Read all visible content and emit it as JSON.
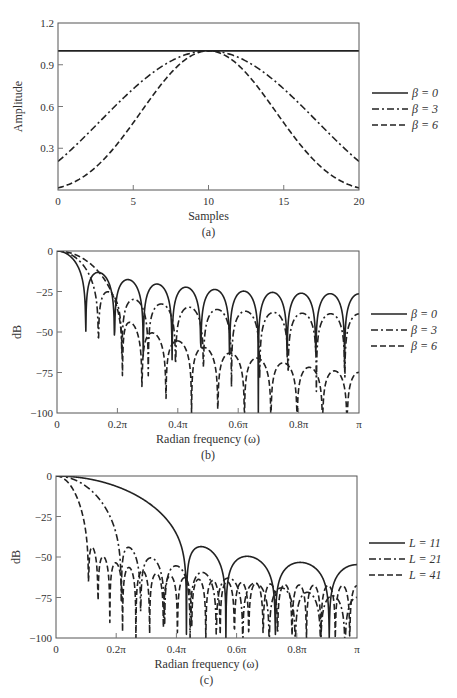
{
  "chart_data": [
    {
      "id": "a",
      "type": "line",
      "caption": "(a)",
      "title": "",
      "xlabel": "Samples",
      "ylabel": "Amplitude",
      "xlim": [
        0,
        20
      ],
      "ylim": [
        0,
        1.2
      ],
      "xticks": [
        0,
        5,
        10,
        15,
        20
      ],
      "xtick_labels": [
        "0",
        "5",
        "10",
        "15",
        "20"
      ],
      "yticks": [
        0,
        0.3,
        0.6,
        0.9,
        1.2
      ],
      "ytick_labels": [
        "0",
        "0.3",
        "0.6",
        "0.9",
        "1.2"
      ],
      "grid": false,
      "legend_position": "right",
      "x": [
        0,
        2,
        4,
        6,
        8,
        10,
        12,
        14,
        16,
        18,
        20
      ],
      "series": [
        {
          "name": "β = 0",
          "style": "solid",
          "values": [
            1.0,
            1.0,
            1.0,
            1.0,
            1.0,
            1.0,
            1.0,
            1.0,
            1.0,
            1.0,
            1.0
          ]
        },
        {
          "name": "β = 3",
          "style": "dashdot",
          "values": [
            0.21,
            0.41,
            0.62,
            0.8,
            0.95,
            1.0,
            0.95,
            0.8,
            0.62,
            0.41,
            0.21
          ]
        },
        {
          "name": "β = 6",
          "style": "dashed",
          "values": [
            0.015,
            0.09,
            0.27,
            0.54,
            0.86,
            1.0,
            0.86,
            0.54,
            0.27,
            0.09,
            0.015
          ]
        }
      ],
      "legend": [
        {
          "label": "β = 0",
          "style": "solid"
        },
        {
          "label": "β = 3",
          "style": "dashdot"
        },
        {
          "label": "β = 6",
          "style": "dashed"
        }
      ],
      "window_length": 21,
      "kaiser_betas": [
        0,
        3,
        6
      ]
    },
    {
      "id": "b",
      "type": "line",
      "caption": "(b)",
      "title": "",
      "xlabel": "Radian frequency (ω)",
      "ylabel": "dB",
      "xlim": [
        0,
        3.14159
      ],
      "ylim": [
        -100,
        0
      ],
      "xticks": [
        0,
        0.2,
        0.4,
        0.6,
        0.8,
        1.0
      ],
      "xtick_labels": [
        "0",
        "0.2π",
        "0.4π",
        "0.6π",
        "0.8π",
        "π"
      ],
      "yticks": [
        0,
        -25,
        -50,
        -75,
        -100
      ],
      "ytick_labels": [
        "0",
        "−25",
        "−50",
        "−75",
        "−100"
      ],
      "grid": false,
      "legend_position": "right",
      "series": [
        {
          "name": "β = 0",
          "style": "solid",
          "first_sidelobe_db": -13,
          "far_sidelobe_db": -27,
          "window_length": 21,
          "beta": 0
        },
        {
          "name": "β = 3",
          "style": "dashdot",
          "first_sidelobe_db": -23,
          "far_sidelobe_db": -38,
          "window_length": 21,
          "beta": 3
        },
        {
          "name": "β = 6",
          "style": "dashed",
          "first_sidelobe_db": -44,
          "far_sidelobe_db": -74,
          "window_length": 21,
          "beta": 6
        }
      ],
      "legend": [
        {
          "label": "β = 0",
          "style": "solid"
        },
        {
          "label": "β = 3",
          "style": "dashdot"
        },
        {
          "label": "β = 6",
          "style": "dashed"
        }
      ]
    },
    {
      "id": "c",
      "type": "line",
      "caption": "(c)",
      "title": "",
      "xlabel": "Radian frequency (ω)",
      "ylabel": "dB",
      "xlim": [
        0,
        3.14159
      ],
      "ylim": [
        -100,
        0
      ],
      "xticks": [
        0,
        0.2,
        0.4,
        0.6,
        0.8,
        1.0
      ],
      "xtick_labels": [
        "0",
        "0.2π",
        "0.4π",
        "0.6π",
        "0.8π",
        "π"
      ],
      "yticks": [
        0,
        -25,
        -50,
        -75,
        -100
      ],
      "ytick_labels": [
        "0",
        "−25",
        "−50",
        "−75",
        "−100"
      ],
      "grid": false,
      "legend_position": "right",
      "series": [
        {
          "name": "L = 11",
          "style": "solid",
          "window_length": 11,
          "beta": 6,
          "first_sidelobe_db": -43
        },
        {
          "name": "L = 21",
          "style": "dashdot",
          "window_length": 21,
          "beta": 6,
          "first_sidelobe_db": -44
        },
        {
          "name": "L = 41",
          "style": "dashed",
          "window_length": 41,
          "beta": 6,
          "first_sidelobe_db": -45
        }
      ],
      "legend": [
        {
          "label": "L = 11",
          "style": "solid"
        },
        {
          "label": "L = 21",
          "style": "dashdot"
        },
        {
          "label": "L = 41",
          "style": "dashed"
        }
      ]
    }
  ],
  "layout": {
    "panels": [
      {
        "left": 58,
        "top": 23,
        "right": 359,
        "bottom": 190,
        "legend_x": 372,
        "legend_y": 93
      },
      {
        "left": 57,
        "top": 251,
        "right": 359,
        "bottom": 413,
        "legend_x": 371,
        "legend_y": 314
      },
      {
        "left": 56,
        "top": 476,
        "right": 357,
        "bottom": 638,
        "legend_x": 369,
        "legend_y": 543
      }
    ]
  },
  "colors": {
    "line": "#222222",
    "frame": "#555555",
    "text": "#333333",
    "background": "#ffffff"
  }
}
